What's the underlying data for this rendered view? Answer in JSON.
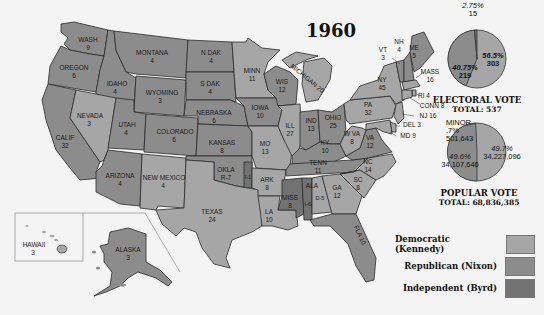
{
  "title": "1960",
  "colors": {
    "democratic": "#a6a6a6",
    "republican": "#8c8c8c",
    "independent": "#727272",
    "background": "#f4f4f4",
    "water": "#ffffff"
  },
  "states": [
    {
      "abbr": "WASH",
      "votes": "9",
      "party": "republican"
    },
    {
      "abbr": "OREGON",
      "votes": "6",
      "party": "republican"
    },
    {
      "abbr": "CALIF",
      "votes": "32",
      "party": "republican"
    },
    {
      "abbr": "IDAHO",
      "votes": "4",
      "party": "republican"
    },
    {
      "abbr": "NEVADA",
      "votes": "3",
      "party": "democratic"
    },
    {
      "abbr": "MONTANA",
      "votes": "4",
      "party": "republican"
    },
    {
      "abbr": "WYOMING",
      "votes": "3",
      "party": "republican"
    },
    {
      "abbr": "UTAH",
      "votes": "4",
      "party": "republican"
    },
    {
      "abbr": "COLORADO",
      "votes": "6",
      "party": "republican"
    },
    {
      "abbr": "ARIZONA",
      "votes": "4",
      "party": "republican"
    },
    {
      "abbr": "NEW MEXICO",
      "votes": "4",
      "party": "democratic"
    },
    {
      "abbr": "N DAK",
      "votes": "4",
      "party": "republican"
    },
    {
      "abbr": "S DAK",
      "votes": "4",
      "party": "republican"
    },
    {
      "abbr": "NEBRASKA",
      "votes": "6",
      "party": "republican"
    },
    {
      "abbr": "KANSAS",
      "votes": "8",
      "party": "republican"
    },
    {
      "abbr": "OKLA",
      "votes": "R-7",
      "party": "republican"
    },
    {
      "abbr": "I-1",
      "votes": "",
      "party": "independent"
    },
    {
      "abbr": "TEXAS",
      "votes": "24",
      "party": "democratic"
    },
    {
      "abbr": "MINN",
      "votes": "11",
      "party": "democratic"
    },
    {
      "abbr": "IOWA",
      "votes": "10",
      "party": "republican"
    },
    {
      "abbr": "MO",
      "votes": "13",
      "party": "democratic"
    },
    {
      "abbr": "ARK",
      "votes": "8",
      "party": "democratic"
    },
    {
      "abbr": "LA",
      "votes": "10",
      "party": "democratic"
    },
    {
      "abbr": "WIS",
      "votes": "12",
      "party": "republican"
    },
    {
      "abbr": "ILL",
      "votes": "27",
      "party": "democratic"
    },
    {
      "abbr": "MICHIGAN",
      "votes": "20",
      "party": "democratic"
    },
    {
      "abbr": "IND",
      "votes": "13",
      "party": "republican"
    },
    {
      "abbr": "OHIO",
      "votes": "25",
      "party": "republican"
    },
    {
      "abbr": "KY",
      "votes": "10",
      "party": "republican"
    },
    {
      "abbr": "TENN",
      "votes": "11",
      "party": "republican"
    },
    {
      "abbr": "MISS",
      "votes": "8",
      "party": "independent"
    },
    {
      "abbr": "ALA",
      "votes": "I-6 D-5",
      "party": "split"
    },
    {
      "abbr": "GA",
      "votes": "12",
      "party": "democratic"
    },
    {
      "abbr": "FLA",
      "votes": "10",
      "party": "republican"
    },
    {
      "abbr": "SC",
      "votes": "8",
      "party": "democratic"
    },
    {
      "abbr": "NC",
      "votes": "14",
      "party": "democratic"
    },
    {
      "abbr": "VA",
      "votes": "12",
      "party": "republican"
    },
    {
      "abbr": "W VA",
      "votes": "8",
      "party": "democratic"
    },
    {
      "abbr": "PA",
      "votes": "32",
      "party": "democratic"
    },
    {
      "abbr": "NY",
      "votes": "45",
      "party": "democratic"
    },
    {
      "abbr": "VT",
      "votes": "3",
      "party": "republican"
    },
    {
      "abbr": "NH",
      "votes": "4",
      "party": "republican"
    },
    {
      "abbr": "ME",
      "votes": "5",
      "party": "republican"
    },
    {
      "abbr": "MASS",
      "votes": "16",
      "party": "democratic"
    },
    {
      "abbr": "RI",
      "votes": "4",
      "party": "democratic"
    },
    {
      "abbr": "CONN",
      "votes": "8",
      "party": "democratic"
    },
    {
      "abbr": "NJ",
      "votes": "16",
      "party": "democratic"
    },
    {
      "abbr": "DEL",
      "votes": "3",
      "party": "democratic"
    },
    {
      "abbr": "MD",
      "votes": "9",
      "party": "democratic"
    },
    {
      "abbr": "HAWAII",
      "votes": "3",
      "party": "democratic"
    },
    {
      "abbr": "ALASKA",
      "votes": "3",
      "party": "republican"
    }
  ],
  "labels": {
    "wash": "WASH",
    "wash_v": "9",
    "oregon": "OREGON",
    "oregon_v": "6",
    "calif": "CALIF",
    "calif_v": "32",
    "idaho": "IDAHO",
    "idaho_v": "4",
    "nevada": "NEVADA",
    "nevada_v": "3",
    "montana": "MONTANA",
    "montana_v": "4",
    "wyoming": "WYOMING",
    "wyoming_v": "3",
    "utah": "UTAH",
    "utah_v": "4",
    "colorado": "COLORADO",
    "colorado_v": "6",
    "arizona": "ARIZONA",
    "arizona_v": "4",
    "newmexico": "NEW MEXICO",
    "newmexico_v": "4",
    "ndak": "N DAK",
    "ndak_v": "4",
    "sdak": "S DAK",
    "sdak_v": "4",
    "nebraska": "NEBRASKA",
    "nebraska_v": "6",
    "kansas": "KANSAS",
    "kansas_v": "8",
    "okla": "OKLA",
    "okla_v": "R-7",
    "okla_i": "I-1",
    "texas": "TEXAS",
    "texas_v": "24",
    "minn": "MINN",
    "minn_v": "11",
    "iowa": "IOWA",
    "iowa_v": "10",
    "mo": "MO",
    "mo_v": "13",
    "ark": "ARK",
    "ark_v": "8",
    "la": "LA",
    "la_v": "10",
    "wis": "WIS",
    "wis_v": "12",
    "ill": "ILL",
    "ill_v": "27",
    "mich": "MICHIGAN 20",
    "ind": "IND",
    "ind_v": "13",
    "ohio": "OHIO",
    "ohio_v": "25",
    "ky": "KY",
    "ky_v": "10",
    "tenn": "TENN",
    "tenn_v": "11",
    "miss": "MISS",
    "miss_v": "8",
    "ala": "ALA",
    "ala_i": "I-6",
    "ala_d": "D-5",
    "ga": "GA",
    "ga_v": "12",
    "fla": "FLA 10",
    "sc": "SC",
    "sc_v": "8",
    "nc": "NC",
    "nc_v": "14",
    "va": "VA",
    "va_v": "12",
    "wva": "W VA",
    "wva_v": "8",
    "pa": "PA",
    "pa_v": "32",
    "ny": "NY",
    "ny_v": "45",
    "vt": "VT",
    "vt_v": "3",
    "nh": "NH",
    "nh_v": "4",
    "me": "ME",
    "me_v": "5",
    "mass": "MASS",
    "mass_v": "16",
    "ri": "RI 4",
    "conn": "CONN 8",
    "nj": "NJ 16",
    "del": "DEL 3",
    "md": "MD 9",
    "hawaii": "HAWAII",
    "hawaii_v": "3",
    "alaska": "ALASKA",
    "alaska_v": "3"
  },
  "electoral_pie": {
    "caption_line1": "ELECTORAL VOTE",
    "caption_line2": "TOTAL: 537",
    "slices": [
      {
        "party": "Democratic",
        "pct": "56.5%",
        "votes": "303"
      },
      {
        "party": "Republican",
        "pct": "40.75%",
        "votes": "219"
      },
      {
        "party": "Independent",
        "pct": "2.75%",
        "votes": "15"
      }
    ]
  },
  "popular_pie": {
    "caption_line1": "POPULAR VOTE",
    "caption_line2": "TOTAL: 68,836,385",
    "slices": [
      {
        "party": "Democratic",
        "pct": "49.7%",
        "votes": "34,227,096"
      },
      {
        "party": "Republican",
        "pct": "49.6%",
        "votes": "34,107,646"
      },
      {
        "party": "Minor",
        "pct": "MINOR .7%",
        "votes": "501,643"
      }
    ]
  },
  "legend": [
    {
      "label": "Democratic (Kennedy)",
      "color": "#a6a6a6"
    },
    {
      "label": "Republican (Nixon)",
      "color": "#8c8c8c"
    },
    {
      "label": "Independent (Byrd)",
      "color": "#727272"
    }
  ]
}
